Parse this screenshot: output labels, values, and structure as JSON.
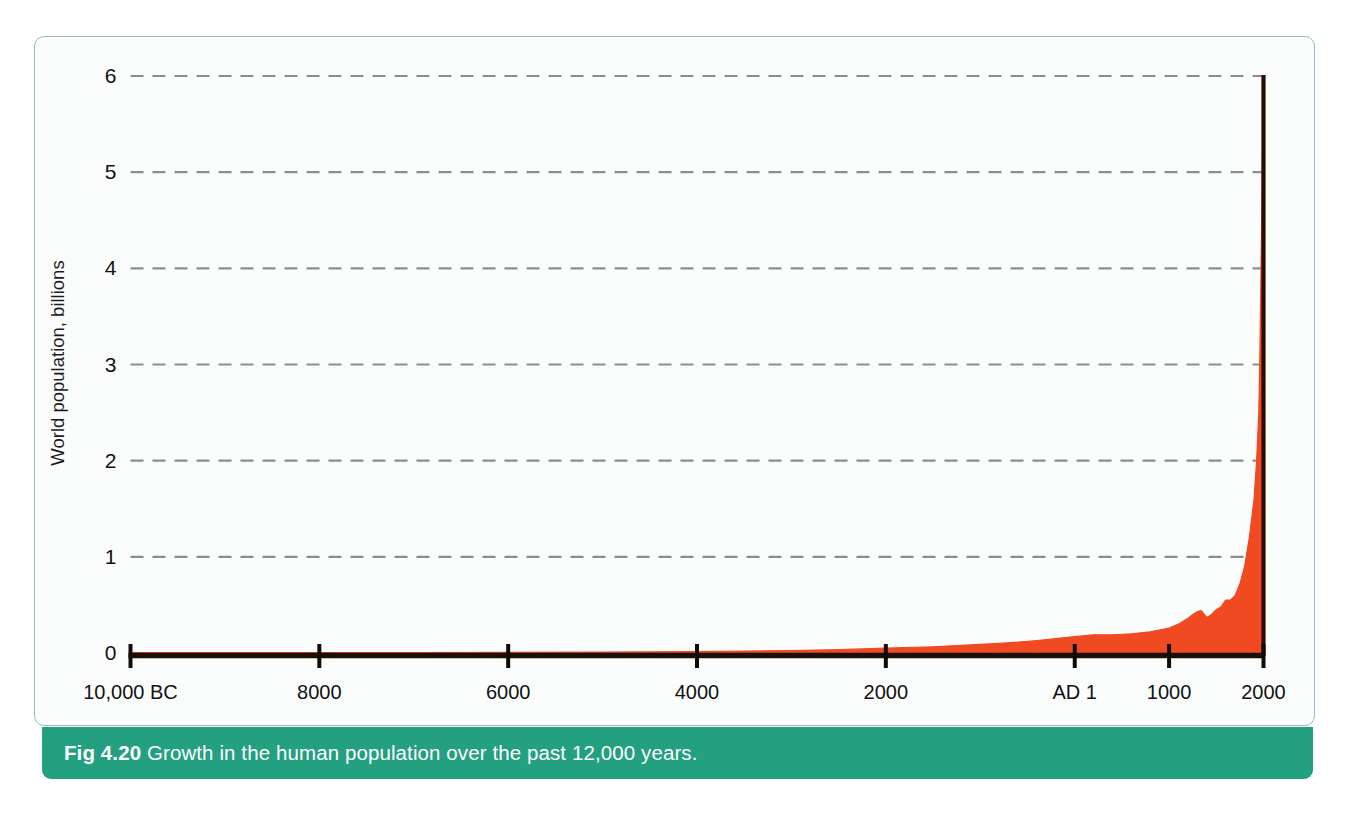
{
  "figure": {
    "caption_label": "Fig 4.20",
    "caption_text": " Growth in the human population over the past 12,000 years.",
    "frame_color": "#8cc2b7",
    "caption_bar_color": "#23a080",
    "caption_text_color": "#ffffff",
    "panel_background": "#fbfdfd"
  },
  "chart_data": {
    "type": "area",
    "title": "",
    "subtitle": "",
    "xlabel": "",
    "ylabel": "World population, billions",
    "series_color": "#f04a23",
    "axis_color": "#1a1008",
    "gridline_color": "#8d8d8d",
    "grid": true,
    "legend": null,
    "xlim": [
      -10000,
      2000
    ],
    "ylim": [
      0,
      6
    ],
    "y_ticks": [
      0,
      1,
      2,
      3,
      4,
      5,
      6
    ],
    "y_tick_labels": [
      "0",
      "1",
      "2",
      "3",
      "4",
      "5",
      "6"
    ],
    "x_ticks": [
      -10000,
      -8000,
      -6000,
      -4000,
      -2000,
      1,
      1000,
      2000
    ],
    "x_tick_labels": [
      "10,000 BC",
      "8000",
      "6000",
      "4000",
      "2000",
      "AD 1",
      "1000",
      "2000"
    ],
    "x": [
      -10000,
      -9000,
      -8000,
      -7000,
      -6000,
      -5000,
      -4500,
      -4000,
      -3500,
      -3000,
      -2500,
      -2000,
      -1500,
      -1000,
      -800,
      -500,
      -400,
      -200,
      1,
      200,
      400,
      600,
      800,
      1000,
      1100,
      1200,
      1250,
      1300,
      1340,
      1400,
      1450,
      1500,
      1550,
      1600,
      1650,
      1700,
      1750,
      1800,
      1850,
      1900,
      1927,
      1950,
      1960,
      1970,
      1980,
      1990,
      2000
    ],
    "values": [
      0.004,
      0.004,
      0.005,
      0.005,
      0.007,
      0.01,
      0.012,
      0.015,
      0.02,
      0.025,
      0.035,
      0.05,
      0.065,
      0.09,
      0.1,
      0.12,
      0.13,
      0.15,
      0.17,
      0.19,
      0.19,
      0.2,
      0.22,
      0.26,
      0.3,
      0.36,
      0.4,
      0.43,
      0.44,
      0.37,
      0.4,
      0.45,
      0.48,
      0.55,
      0.55,
      0.6,
      0.72,
      0.9,
      1.2,
      1.6,
      2.0,
      2.5,
      3.0,
      3.7,
      4.45,
      5.3,
      6.0
    ],
    "annotations": []
  }
}
